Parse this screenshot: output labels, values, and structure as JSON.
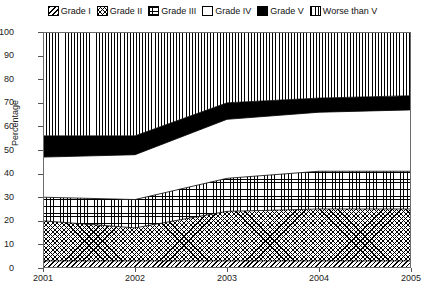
{
  "legend": {
    "position": "top-center",
    "items": [
      {
        "label": "Grade I",
        "pattern": "diagonal-hatch",
        "icon": "legend-swatch-icon"
      },
      {
        "label": "Grade II",
        "pattern": "cross-hatch",
        "icon": "legend-swatch-icon"
      },
      {
        "label": "Grade III",
        "pattern": "fine-grid-dot",
        "icon": "legend-swatch-icon"
      },
      {
        "label": "Grade IV",
        "pattern": "blank-white",
        "icon": "legend-swatch-icon"
      },
      {
        "label": "Grade V",
        "pattern": "solid-black",
        "icon": "legend-swatch-icon"
      },
      {
        "label": "Worse than V",
        "pattern": "vertical-lines",
        "icon": "legend-swatch-icon"
      }
    ]
  },
  "axes": {
    "ylabel": "Percentage",
    "yticks": [
      "0",
      "10",
      "20",
      "30",
      "40",
      "50",
      "60",
      "70",
      "80",
      "90",
      "100"
    ],
    "xticks": [
      "2001",
      "2002",
      "2003",
      "2004",
      "2005"
    ]
  },
  "chart_data": {
    "type": "area",
    "stacked": true,
    "title": "",
    "subtitle": "",
    "xlabel": "",
    "ylabel": "Percentage",
    "x": [
      "2001",
      "2002",
      "2003",
      "2004",
      "2005"
    ],
    "categories": [
      "2001",
      "2002",
      "2003",
      "2004",
      "2005"
    ],
    "ylim": [
      0,
      100
    ],
    "xlim": [
      "2001",
      "2005"
    ],
    "ytick_step": 10,
    "grid": false,
    "legend_position": "top-center",
    "series": [
      {
        "name": "Grade I",
        "pattern": "diagonal-hatch",
        "values": [
          3,
          3,
          3,
          3,
          3
        ],
        "cumulative": [
          3,
          3,
          3,
          3,
          3
        ]
      },
      {
        "name": "Grade II",
        "pattern": "cross-hatch",
        "values": [
          17,
          14,
          21,
          22,
          22
        ],
        "cumulative": [
          20,
          17,
          24,
          25,
          25
        ]
      },
      {
        "name": "Grade III",
        "pattern": "fine-grid-dot",
        "values": [
          10,
          12,
          14,
          16,
          16
        ],
        "cumulative": [
          30,
          29,
          38,
          41,
          41
        ]
      },
      {
        "name": "Grade IV",
        "pattern": "blank-white",
        "values": [
          17,
          19,
          25,
          25,
          26
        ],
        "cumulative": [
          47,
          48,
          63,
          66,
          67
        ]
      },
      {
        "name": "Grade V",
        "pattern": "solid-black",
        "values": [
          9,
          8,
          7,
          6,
          6
        ],
        "cumulative": [
          56,
          56,
          70,
          72,
          73
        ]
      },
      {
        "name": "Worse than V",
        "pattern": "vertical-lines",
        "values": [
          44,
          44,
          30,
          28,
          27
        ],
        "cumulative": [
          100,
          100,
          100,
          100,
          100
        ]
      }
    ]
  }
}
